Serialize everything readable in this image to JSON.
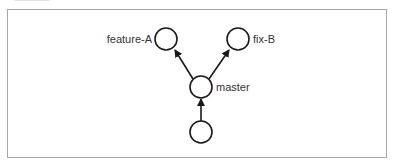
{
  "diagram": {
    "type": "git-branch-graph",
    "nodes": [
      {
        "id": "feature-A",
        "label": "feature-A",
        "cx": 166,
        "cy": 39
      },
      {
        "id": "fix-B",
        "label": "fix-B",
        "cx": 238,
        "cy": 39
      },
      {
        "id": "master",
        "label": "master",
        "cx": 201,
        "cy": 87
      },
      {
        "id": "base",
        "label": "",
        "cx": 201,
        "cy": 132
      }
    ],
    "edges": [
      {
        "from": "base",
        "to": "master"
      },
      {
        "from": "master",
        "to": "feature-A"
      },
      {
        "from": "master",
        "to": "fix-B"
      }
    ],
    "colors": {
      "stroke": "#1a1a1a",
      "border": "#a8a8a8",
      "text": "#333333"
    }
  }
}
